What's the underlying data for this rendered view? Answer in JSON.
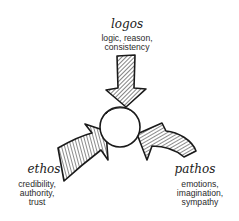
{
  "diagram": {
    "center": {
      "label": ""
    },
    "nodes": [
      {
        "id": "logos",
        "title": "logos",
        "lines": [
          "logic, reason,",
          "consistency"
        ]
      },
      {
        "id": "ethos",
        "title": "ethos",
        "lines": [
          "credibility,",
          "authority,",
          "trust"
        ]
      },
      {
        "id": "pathos",
        "title": "pathos",
        "lines": [
          "emotions,",
          "imagination,",
          "sympathy"
        ]
      }
    ],
    "colors": {
      "ink": "#1a1a1a",
      "text": "#2a2a2a",
      "background": "#ffffff"
    }
  }
}
